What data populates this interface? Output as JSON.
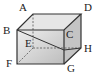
{
  "diagram": {
    "type": "cuboid",
    "vertices": {
      "A": {
        "label": "A",
        "x": 33,
        "y": 14
      },
      "B": {
        "label": "B",
        "x": 17,
        "y": 30
      },
      "C": {
        "label": "C",
        "x": 64,
        "y": 30
      },
      "D": {
        "label": "D",
        "x": 81,
        "y": 14
      },
      "E": {
        "label": "E",
        "x": 33,
        "y": 48
      },
      "F": {
        "label": "F",
        "x": 17,
        "y": 64
      },
      "G": {
        "label": "G",
        "x": 64,
        "y": 64
      },
      "H": {
        "label": "H",
        "x": 81,
        "y": 48
      }
    },
    "colors": {
      "edge": "#333333",
      "front": "#c8c8c8",
      "top": "#e4e4e4",
      "side": "#b8b8b8"
    }
  }
}
